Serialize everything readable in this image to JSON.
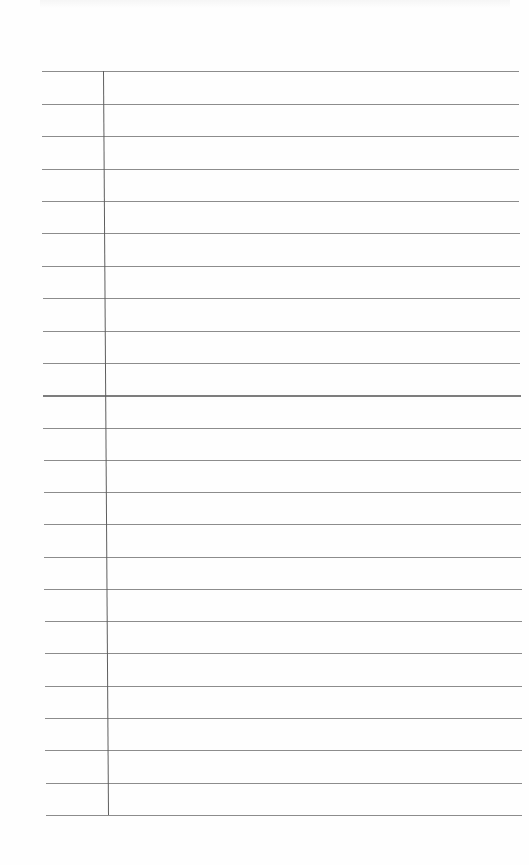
{
  "sheet": {
    "type": "lined notebook paper",
    "background_color": "#fefefe",
    "rule_color": "#8c8c8c",
    "margin_color": "#5e5e5e",
    "rule_count": 24,
    "rules": [
      {
        "y": 71,
        "x1": 42,
        "x2": 519,
        "heavy": false
      },
      {
        "y": 104,
        "x1": 42,
        "x2": 519,
        "heavy": false
      },
      {
        "y": 136,
        "x1": 42,
        "x2": 519,
        "heavy": false
      },
      {
        "y": 169,
        "x1": 42,
        "x2": 519,
        "heavy": false
      },
      {
        "y": 201,
        "x1": 42,
        "x2": 519,
        "heavy": false
      },
      {
        "y": 233,
        "x1": 42,
        "x2": 520,
        "heavy": false
      },
      {
        "y": 266,
        "x1": 42,
        "x2": 520,
        "heavy": false
      },
      {
        "y": 298,
        "x1": 43,
        "x2": 520,
        "heavy": false
      },
      {
        "y": 331,
        "x1": 43,
        "x2": 520,
        "heavy": false
      },
      {
        "y": 363,
        "x1": 43,
        "x2": 520,
        "heavy": false
      },
      {
        "y": 395,
        "x1": 43,
        "x2": 521,
        "heavy": true
      },
      {
        "y": 428,
        "x1": 43,
        "x2": 521,
        "heavy": false
      },
      {
        "y": 460,
        "x1": 44,
        "x2": 521,
        "heavy": false
      },
      {
        "y": 492,
        "x1": 44,
        "x2": 521,
        "heavy": false
      },
      {
        "y": 524,
        "x1": 44,
        "x2": 521,
        "heavy": false
      },
      {
        "y": 557,
        "x1": 44,
        "x2": 521,
        "heavy": false
      },
      {
        "y": 589,
        "x1": 44,
        "x2": 522,
        "heavy": false
      },
      {
        "y": 621,
        "x1": 45,
        "x2": 522,
        "heavy": false
      },
      {
        "y": 653,
        "x1": 45,
        "x2": 522,
        "heavy": false
      },
      {
        "y": 686,
        "x1": 45,
        "x2": 522,
        "heavy": false
      },
      {
        "y": 718,
        "x1": 45,
        "x2": 522,
        "heavy": false
      },
      {
        "y": 750,
        "x1": 45,
        "x2": 522,
        "heavy": false
      },
      {
        "y": 783,
        "x1": 46,
        "x2": 522,
        "heavy": false
      },
      {
        "y": 815,
        "x1": 46,
        "x2": 522,
        "heavy": false
      }
    ],
    "margin": {
      "x_top": 103,
      "x_bottom": 108,
      "y_top": 71,
      "y_bottom": 815
    }
  }
}
